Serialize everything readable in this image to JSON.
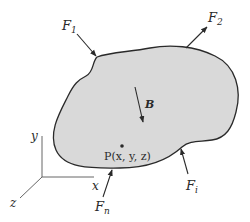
{
  "figure": {
    "body_fill": "#d9d9d9",
    "outline_color": "#2a2a2a",
    "labels": {
      "F1": {
        "main": "F",
        "sub": "1"
      },
      "F2": {
        "main": "F",
        "sub": "2"
      },
      "Fi": {
        "main": "F",
        "sub": "i"
      },
      "Fn": {
        "main": "F",
        "sub": "n"
      },
      "B": "B",
      "P": "P(x, y, z)"
    },
    "axes": {
      "x": "x",
      "y": "y",
      "z": "z"
    }
  }
}
